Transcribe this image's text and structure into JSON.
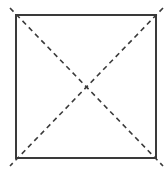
{
  "diagram": {
    "type": "square-with-diagonals",
    "background": "#ffffff",
    "stroke_color": "#3a3a3a",
    "square": {
      "x1": 16,
      "y1": 15,
      "x2": 156,
      "y2": 158,
      "stroke_width": 2
    },
    "diagonals": [
      {
        "x1": 10,
        "y1": 8,
        "x2": 163,
        "y2": 166,
        "style": "dashed"
      },
      {
        "x1": 163,
        "y1": 8,
        "x2": 10,
        "y2": 166,
        "style": "dashed"
      }
    ],
    "dash_pattern": "5,4",
    "diagonal_stroke_width": 1.6
  }
}
